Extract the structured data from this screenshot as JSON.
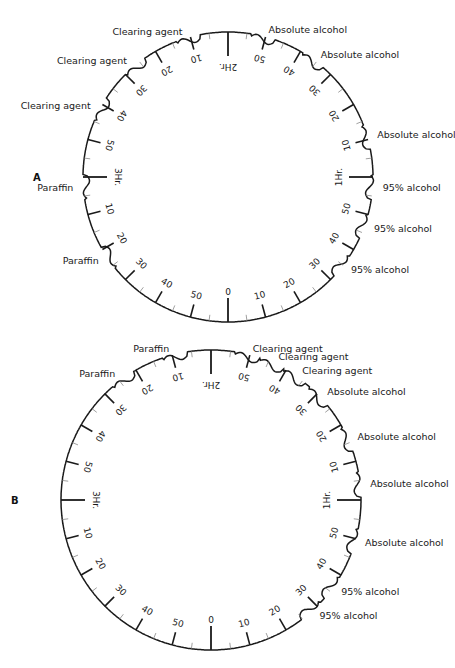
{
  "colors": {
    "ink": "#1a1a1a",
    "background": "#ffffff"
  },
  "diagrams": [
    {
      "id": "A",
      "panel_letter": "A",
      "center": [
        228,
        177
      ],
      "radius": 145,
      "hour_labels": {
        "top": "2Hr.",
        "right": "1Hr.",
        "left": "3Hr.",
        "bottom": "0"
      },
      "stations": [
        {
          "label": "95% alcohol",
          "notch_deg": 52
        },
        {
          "label": "95% alcohol",
          "notch_deg": 70
        },
        {
          "label": "95% alcohol",
          "notch_deg": 86
        },
        {
          "label": "Absolute alcohol",
          "notch_deg": 106
        },
        {
          "label": "Absolute alcohol",
          "notch_deg": 144
        },
        {
          "label": "Absolute alcohol",
          "notch_deg": 166
        },
        {
          "label": "Clearing agent",
          "notch_deg": 196
        },
        {
          "label": "Clearing agent",
          "notch_deg": 220
        },
        {
          "label": "Clearing agent",
          "notch_deg": 242
        },
        {
          "label": "Paraffin",
          "notch_deg": 274
        },
        {
          "label": "Paraffin",
          "notch_deg": 304
        }
      ]
    },
    {
      "id": "B",
      "panel_letter": "B",
      "center": [
        211,
        500
      ],
      "radius": 150,
      "hour_labels": {
        "top": "2Hr.",
        "right": "1Hr.",
        "left": "3Hr.",
        "bottom": "0"
      },
      "stations": [
        {
          "label": "95% alcohol",
          "notch_deg": 42
        },
        {
          "label": "95% alcohol",
          "notch_deg": 54
        },
        {
          "label": "Absolute alcohol",
          "notch_deg": 74
        },
        {
          "label": "Absolute alcohol",
          "notch_deg": 96
        },
        {
          "label": "Absolute alcohol",
          "notch_deg": 114
        },
        {
          "label": "Absolute alcohol",
          "notch_deg": 134
        },
        {
          "label": "Clearing agent",
          "notch_deg": 146
        },
        {
          "label": "Clearing agent",
          "notch_deg": 156
        },
        {
          "label": "Clearing agent",
          "notch_deg": 166
        },
        {
          "label": "Paraffin",
          "notch_deg": 194
        },
        {
          "label": "Paraffin",
          "notch_deg": 216
        }
      ]
    }
  ],
  "minute_labels": [
    "0",
    "10",
    "20",
    "30",
    "40",
    "50"
  ],
  "caption_note": "Tissue processor timing dials: 3-hour rotation, minute marks every 10 min, stations indicated by notches"
}
